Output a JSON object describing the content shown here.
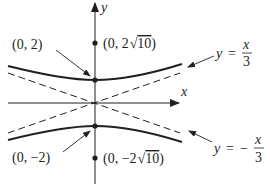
{
  "figure": {
    "type": "hyperbola-graph",
    "equation": "y^2/4 - x^2/36 = 1",
    "axes": {
      "x_label": "x",
      "y_label": "y"
    },
    "points": [
      {
        "id": "vertex-top",
        "label": "(0, 2)",
        "x": 0,
        "y": 2
      },
      {
        "id": "vertex-bottom",
        "label": "(0, −2)",
        "x": 0,
        "y": -2
      },
      {
        "id": "focus-top",
        "label_prefix": "(0, 2",
        "label_radicand": "10",
        "label_suffix": ")",
        "x": 0,
        "y": "2√10"
      },
      {
        "id": "focus-bottom",
        "label_prefix": "(0, −2",
        "label_radicand": "10",
        "label_suffix": ")",
        "x": 0,
        "y": "-2√10"
      }
    ],
    "asymptotes": [
      {
        "id": "asymptote-positive",
        "lhs": "y =",
        "sign": "",
        "num": "x",
        "den": "3"
      },
      {
        "id": "asymptote-negative",
        "lhs": "y =",
        "sign": "−",
        "num": "x",
        "den": "3"
      }
    ],
    "colors": {
      "ink": "#231f20",
      "background": "#ffffff"
    }
  }
}
